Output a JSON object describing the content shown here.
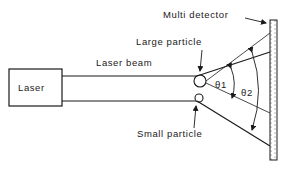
{
  "diagram": {
    "laser_label": "Laser",
    "beam_label": "Laser beam",
    "large_particle_label": "Large particle",
    "small_particle_label": "Small particle",
    "detector_label": "Multi detector",
    "angle1_label": "θ1",
    "angle2_label": "θ2",
    "colors": {
      "ink": "#1a1a1a",
      "background": "#ffffff"
    }
  }
}
